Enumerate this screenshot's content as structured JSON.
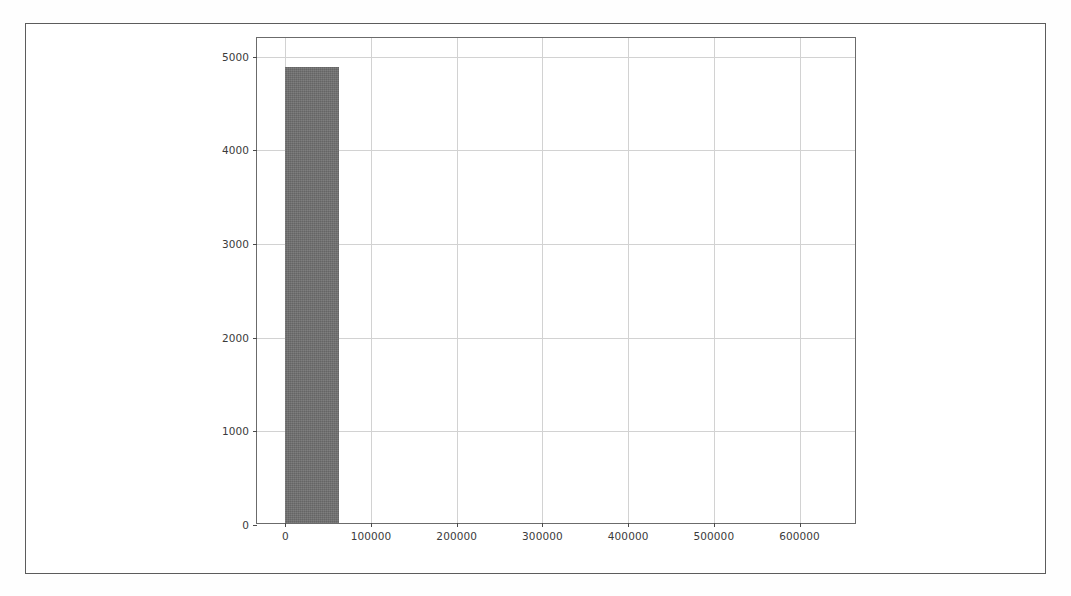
{
  "figure": {
    "background_color": "#ffffff",
    "frame_color": "#5c5c5c",
    "axes_color": "#6b6b6b",
    "grid_color": "#d2d2d2",
    "bar_color": "#6f6f6f",
    "tick_label_color": "#3b3b3b"
  },
  "chart_data": {
    "type": "bar",
    "title": "",
    "subtitle": "",
    "xlabel": "",
    "ylabel": "",
    "legend": [],
    "annotations": [],
    "grid": true,
    "legend_position": "none",
    "xlim": [
      -33000,
      667000
    ],
    "ylim": [
      0,
      5200
    ],
    "xticks": [
      0,
      100000,
      200000,
      300000,
      400000,
      500000,
      600000
    ],
    "xticklabels": [
      "0",
      "100000",
      "200000",
      "300000",
      "400000",
      "500000",
      "600000"
    ],
    "yticks": [
      0,
      1000,
      2000,
      3000,
      4000,
      5000
    ],
    "yticklabels": [
      "0",
      "1000",
      "2000",
      "3000",
      "4000",
      "5000"
    ],
    "bars": [
      {
        "label": "0-63000",
        "x_start": 0,
        "x_end": 63000,
        "value": 4870
      }
    ],
    "categories": [
      "0-63000"
    ],
    "values": [
      4870
    ]
  }
}
